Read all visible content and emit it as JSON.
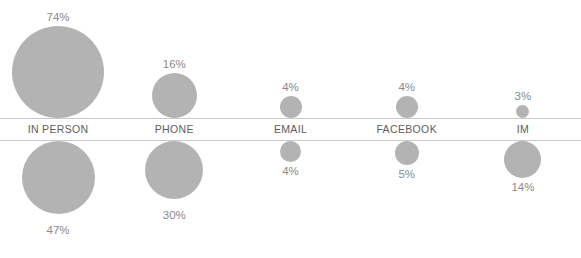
{
  "chart_data": {
    "type": "bubble",
    "title": "",
    "subtitle": "",
    "xlabel": "",
    "ylabel": "",
    "grid": false,
    "legend_position": "none",
    "categories": [
      "IN PERSON",
      "PHONE",
      "EMAIL",
      "FACEBOOK",
      "IM"
    ],
    "series": [
      {
        "name": "top",
        "position": "above-axis",
        "label_position": "above-bubble",
        "values": [
          74,
          16,
          4,
          4,
          3
        ],
        "value_labels": [
          "74%",
          "16%",
          "4%",
          "4%",
          "3%"
        ],
        "bubble_diameters_px": [
          92,
          45,
          22,
          22,
          13
        ]
      },
      {
        "name": "bottom",
        "position": "below-axis",
        "label_position": "below-bubble",
        "values": [
          47,
          30,
          4,
          5,
          14
        ],
        "value_labels": [
          "47%",
          "30%",
          "4%",
          "5%",
          "14%"
        ],
        "bubble_diameters_px": [
          73,
          58,
          21,
          24,
          37
        ]
      }
    ],
    "bubble_color": "#b3b3b3",
    "label_color": "#8a8a8a",
    "category_color": "#5d5d5d",
    "axis_line_color": "#c9c9c9",
    "background": "#ffffff"
  },
  "top": {
    "bubbles": [
      {
        "label": "74%",
        "size": 92
      },
      {
        "label": "16%",
        "size": 45
      },
      {
        "label": "4%",
        "size": 22
      },
      {
        "label": "4%",
        "size": 22
      },
      {
        "label": "3%",
        "size": 13
      }
    ]
  },
  "categories": [
    {
      "label": "IN PERSON"
    },
    {
      "label": "PHONE"
    },
    {
      "label": "EMAIL"
    },
    {
      "label": "FACEBOOK"
    },
    {
      "label": "IM"
    }
  ],
  "bottom": {
    "bubbles": [
      {
        "label": "47%",
        "size": 73
      },
      {
        "label": "30%",
        "size": 58
      },
      {
        "label": "4%",
        "size": 21
      },
      {
        "label": "5%",
        "size": 24
      },
      {
        "label": "14%",
        "size": 37
      }
    ]
  }
}
